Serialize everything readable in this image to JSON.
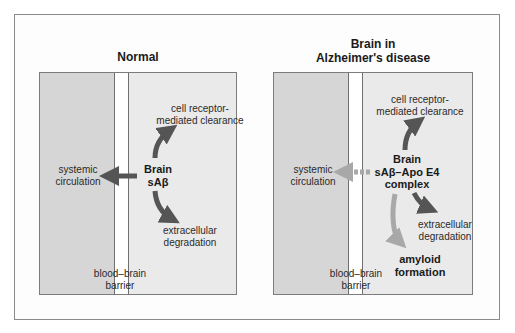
{
  "panels": [
    {
      "title": "Normal",
      "labels": {
        "clearance": [
          "cell receptor-",
          "mediated clearance"
        ],
        "systemic": [
          "systemic",
          "circulation"
        ],
        "center": [
          "Brain",
          "sAβ"
        ],
        "degradation": [
          "extracellular",
          "degradation"
        ],
        "barrier": [
          "blood–brain",
          "barrier"
        ]
      }
    },
    {
      "title": [
        "Brain in",
        "Alzheimer's disease"
      ],
      "labels": {
        "clearance": [
          "cell receptor-",
          "mediated clearance"
        ],
        "systemic": [
          "systemic",
          "circulation"
        ],
        "center": [
          "Brain",
          "sAβ–Apo E4",
          "complex"
        ],
        "degradation": [
          "extracellular",
          "degradation"
        ],
        "amyloid": [
          "amyloid",
          "formation"
        ],
        "barrier": [
          "blood–brain",
          "barrier"
        ]
      }
    }
  ],
  "colors": {
    "arrow_dark": "#555555",
    "arrow_light": "#a8a8a8",
    "blood_side": "#d6d6d6",
    "brain_side": "#eaeaea"
  }
}
